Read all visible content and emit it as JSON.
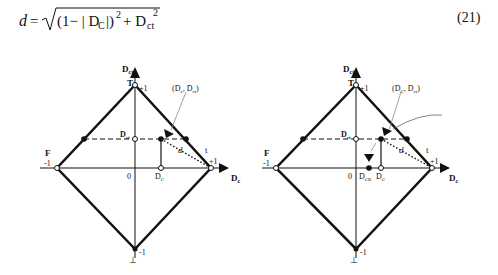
{
  "equation": {
    "lhs": "d",
    "rhs_text": "√((1−|D_C|)² + D_ct²)",
    "number": "(21)"
  },
  "diagrams": [
    {
      "id": "left",
      "axes": {
        "x_label": "Dc",
        "y_label": "Dct"
      },
      "vertices": {
        "top": "T",
        "left": "F",
        "right": "t",
        "bottom": "⊥"
      },
      "ticks": {
        "top": "+1",
        "left": "-1",
        "right": "+1",
        "bottom": "-1",
        "origin": "0"
      },
      "point_label": "(Dc, Dct)",
      "dct_marker": "Dct",
      "dc_marker": "Dc",
      "distance_label": "d"
    },
    {
      "id": "right",
      "axes": {
        "x_label": "Dc",
        "y_label": "Dct"
      },
      "vertices": {
        "top": "T",
        "left": "F",
        "right": "t",
        "bottom": "⊥"
      },
      "ticks": {
        "top": "+1",
        "left": "-1",
        "right": "+1",
        "bottom": "-1",
        "origin": "0"
      },
      "point_label": "(Dc, Dct)",
      "dct_marker": "Dct",
      "dc_marker": "Dc",
      "dcr_marker": "DCR",
      "distance_label": "d"
    }
  ]
}
